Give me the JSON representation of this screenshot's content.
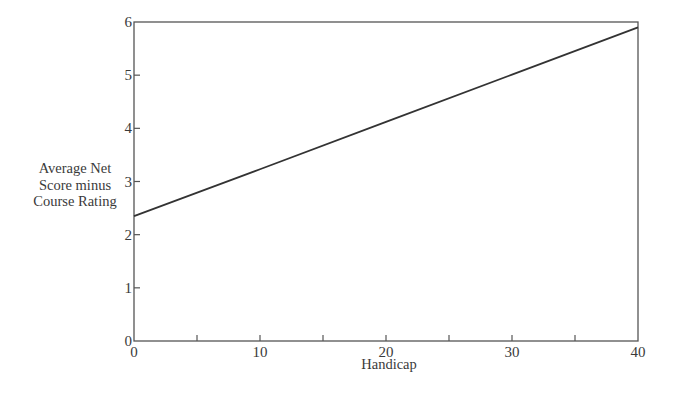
{
  "chart_data": {
    "type": "line",
    "title": "",
    "xlabel": "Handicap",
    "ylabel": "Average Net Score minus Course Rating",
    "ylabel_lines": [
      "Average Net",
      "Score minus",
      "Course Rating"
    ],
    "xlim": [
      0,
      40
    ],
    "ylim": [
      0,
      6
    ],
    "x_ticks_labeled": [
      0,
      10,
      20,
      30,
      40
    ],
    "x_ticks_minor": [
      5,
      15,
      25,
      35
    ],
    "y_ticks": [
      0,
      1,
      2,
      3,
      4,
      5,
      6
    ],
    "grid": false,
    "legend": null,
    "series": [
      {
        "name": "Average Net Score minus Course Rating",
        "x": [
          0,
          10,
          20,
          30,
          40
        ],
        "values": [
          2.35,
          3.23,
          4.12,
          5.01,
          5.9
        ]
      }
    ],
    "colors": {
      "line": "#333333",
      "axis": "#555555"
    }
  }
}
